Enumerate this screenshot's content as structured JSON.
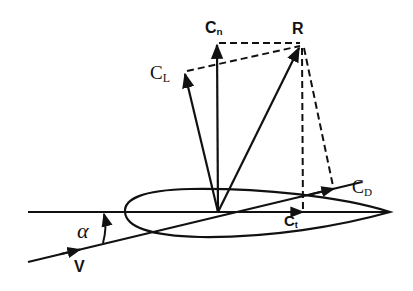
{
  "diagram": {
    "labels": {
      "cn": {
        "main": "C",
        "sub": "n"
      },
      "r": {
        "main": "R"
      },
      "cl": {
        "main": "C",
        "sub": "L"
      },
      "cd": {
        "main": "C",
        "sub": "D"
      },
      "ct": {
        "main": "C",
        "sub": "t"
      },
      "alpha": {
        "main": "α"
      },
      "v": {
        "main": "V"
      }
    },
    "vectors": [
      {
        "id": "resultant",
        "label": "R",
        "style": "solid"
      },
      {
        "id": "normal",
        "label": "Cn",
        "style": "solid"
      },
      {
        "id": "lift",
        "label": "CL",
        "style": "solid"
      },
      {
        "id": "drag",
        "label": "CD",
        "style": "arrowhead-on-line"
      },
      {
        "id": "tangential",
        "label": "Ct",
        "style": "arrowhead-on-line"
      }
    ],
    "projections": [
      {
        "from": "R",
        "to": "Cn",
        "style": "dashed"
      },
      {
        "from": "R",
        "to": "CL",
        "style": "dashed"
      },
      {
        "from": "R",
        "to": "Ct",
        "style": "dashed"
      },
      {
        "from": "R",
        "to": "CD",
        "style": "dashed"
      }
    ],
    "colors": {
      "ink": "#111111",
      "background": "#ffffff"
    }
  }
}
